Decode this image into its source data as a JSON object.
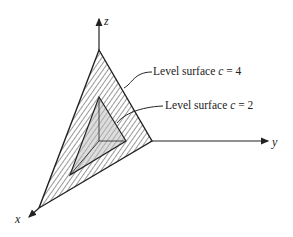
{
  "figure": {
    "axes": {
      "x": "x",
      "y": "y",
      "z": "z"
    },
    "labels": [
      {
        "id": "outer",
        "text_prefix": "Level surface ",
        "var": "c",
        "eq": " = 4"
      },
      {
        "id": "inner",
        "text_prefix": "Level surface ",
        "var": "c",
        "eq": " = 2"
      }
    ]
  }
}
